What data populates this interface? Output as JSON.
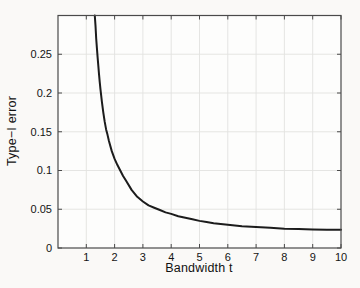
{
  "figure": {
    "background_color": "#faf9f7",
    "plot_background_color": "#fdfdfc",
    "frame_color": "#4a4a4a",
    "grid_color": "#e2e2e0",
    "curve_color": "#1c1c1c",
    "text_color": "#141414",
    "tick_length_px": 4
  },
  "chart_data": {
    "type": "line",
    "title": "",
    "xlabel": "Bandwidth t",
    "ylabel": "Type−I error",
    "xlim": [
      0,
      10
    ],
    "ylim": [
      0,
      0.3
    ],
    "x_ticks": [
      1,
      2,
      3,
      4,
      5,
      6,
      7,
      8,
      9,
      10
    ],
    "x_tick_labels": [
      "1",
      "2",
      "3",
      "4",
      "5",
      "6",
      "7",
      "8",
      "9",
      "10"
    ],
    "y_ticks": [
      0,
      0.05,
      0.1,
      0.15,
      0.2,
      0.25
    ],
    "y_tick_labels": [
      "0",
      "0.05",
      "0.1",
      "0.15",
      "0.2",
      "0.25"
    ],
    "grid": true,
    "legend": "none",
    "series": [
      {
        "name": "Type-I error vs bandwidth",
        "points": [
          [
            1.3,
            0.3
          ],
          [
            1.325,
            0.287
          ],
          [
            1.35,
            0.27
          ],
          [
            1.375,
            0.258
          ],
          [
            1.4,
            0.246
          ],
          [
            1.425,
            0.235
          ],
          [
            1.45,
            0.224
          ],
          [
            1.475,
            0.214
          ],
          [
            1.5,
            0.205
          ],
          [
            1.55,
            0.189
          ],
          [
            1.6,
            0.175
          ],
          [
            1.65,
            0.163
          ],
          [
            1.7,
            0.153
          ],
          [
            1.75,
            0.146
          ],
          [
            1.8,
            0.138
          ],
          [
            1.9,
            0.125
          ],
          [
            2.0,
            0.115
          ],
          [
            2.1,
            0.107
          ],
          [
            2.2,
            0.1
          ],
          [
            2.3,
            0.093
          ],
          [
            2.4,
            0.087
          ],
          [
            2.6,
            0.075
          ],
          [
            2.8,
            0.066
          ],
          [
            3.0,
            0.06
          ],
          [
            3.2,
            0.055
          ],
          [
            3.4,
            0.052
          ],
          [
            3.6,
            0.049
          ],
          [
            3.8,
            0.046
          ],
          [
            4.0,
            0.044
          ],
          [
            4.25,
            0.041
          ],
          [
            4.5,
            0.039
          ],
          [
            4.75,
            0.037
          ],
          [
            5.0,
            0.035
          ],
          [
            5.25,
            0.0335
          ],
          [
            5.5,
            0.032
          ],
          [
            5.75,
            0.031
          ],
          [
            6.0,
            0.03
          ],
          [
            6.25,
            0.029
          ],
          [
            6.5,
            0.028
          ],
          [
            7.0,
            0.027
          ],
          [
            7.5,
            0.026
          ],
          [
            8.0,
            0.025
          ],
          [
            8.5,
            0.0245
          ],
          [
            9.0,
            0.024
          ],
          [
            9.5,
            0.0237
          ],
          [
            10.0,
            0.0235
          ]
        ]
      }
    ]
  }
}
